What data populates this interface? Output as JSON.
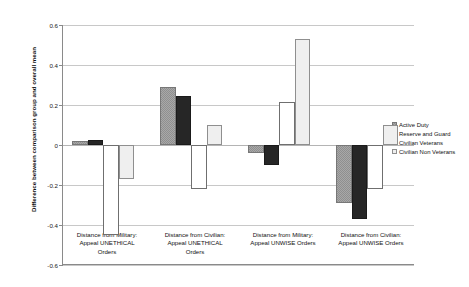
{
  "chart_data": {
    "type": "bar",
    "title": "",
    "xlabel": "",
    "ylabel": "Difference between comparison group and overall mean",
    "ylim": [
      -0.6,
      0.6
    ],
    "yticks": [
      0.6,
      0.4,
      0.2,
      0,
      -0.2,
      -0.4,
      -0.6
    ],
    "ytick_labels": [
      "0.6",
      "0.4",
      "0.2",
      "0",
      "-0.2",
      "-0.4",
      "-0.6"
    ],
    "grid": true,
    "legend_position": "right",
    "categories": [
      "Distance from Military: Appeal UNETHICAL Orders",
      "Distance from Civilian: Appeal UNETHICAL Orders",
      "Distance from Military: Appeal UNWISE Orders",
      "Distance from Civilian: Appeal UNWISE Orders"
    ],
    "category_lines": [
      [
        "Distance from Military:",
        "Appeal UNETHICAL",
        "Orders"
      ],
      [
        "Distance from Civilian:",
        "Appeal UNETHICAL",
        "Orders"
      ],
      [
        "Distance from Military:",
        "Appeal UNWISE Orders"
      ],
      [
        "Distance from Civilian:",
        "Appeal UNWISE Orders"
      ]
    ],
    "series": [
      {
        "name": "Active Duty",
        "color": "#a8a8a8",
        "values": [
          0.02,
          0.29,
          -0.04,
          -0.29
        ]
      },
      {
        "name": "Reserve and Guard",
        "color": "#262626",
        "values": [
          0.025,
          0.245,
          -0.1,
          -0.37
        ]
      },
      {
        "name": "Civilian Veterans",
        "color": "#ffffff",
        "values": [
          -0.45,
          -0.22,
          0.215,
          -0.22
        ]
      },
      {
        "name": "Civilian Non Veterans",
        "color": "#efefef",
        "values": [
          -0.17,
          0.1,
          0.53,
          0.1
        ]
      }
    ]
  },
  "legend": {
    "items": [
      {
        "label": "Active Duty"
      },
      {
        "label": "Reserve and Guard"
      },
      {
        "label": "Civilian Veterans"
      },
      {
        "label": "Civilian Non Veterans"
      }
    ]
  }
}
